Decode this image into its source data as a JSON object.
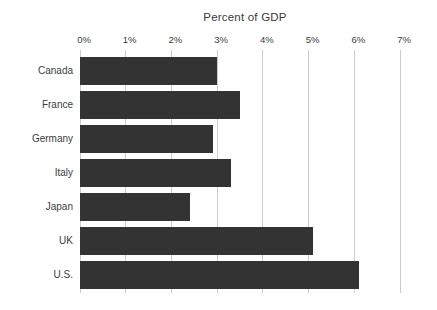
{
  "chart_data": {
    "type": "bar",
    "orientation": "horizontal",
    "title": "Percent of GDP",
    "categories": [
      "Canada",
      "France",
      "Germany",
      "Italy",
      "Japan",
      "UK",
      "U.S."
    ],
    "values": [
      3.0,
      3.5,
      2.9,
      3.3,
      2.4,
      5.1,
      6.1
    ],
    "xlabel": "",
    "ylabel": "",
    "xlim": [
      0,
      7
    ],
    "x_tick_labels": [
      "0%",
      "1%",
      "2%",
      "3%",
      "4%",
      "5%",
      "6%",
      "7%"
    ],
    "tick_step": 1,
    "grid": "vertical",
    "legend": "none",
    "colors": {
      "bar": "#333333",
      "gridline": "#cccccc",
      "text": "#3d3d3d",
      "background": "#ffffff"
    }
  }
}
